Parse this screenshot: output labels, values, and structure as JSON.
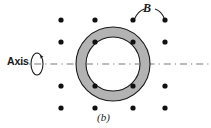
{
  "figure": {
    "panel_label": "(b)",
    "axis_label": "Axis",
    "field_label": "B",
    "colors": {
      "ring_fill": "#b3b3b3",
      "stroke": "#1a1a1a",
      "background": "#ffffff",
      "dot": "#111111",
      "axis_line": "#7a7a7a"
    },
    "geometry": {
      "center_x": 113,
      "center_y": 64,
      "outer_radius": 37,
      "inner_radius": 27,
      "axis_y": 64,
      "ellipse_cx": 37,
      "ellipse_cy": 64,
      "ellipse_rx": 6,
      "ellipse_ry": 11
    },
    "field_dots": [
      {
        "x": 61,
        "y": 20
      },
      {
        "x": 95,
        "y": 20
      },
      {
        "x": 133,
        "y": 20
      },
      {
        "x": 165,
        "y": 20
      },
      {
        "x": 61,
        "y": 42
      },
      {
        "x": 95,
        "y": 42
      },
      {
        "x": 133,
        "y": 42
      },
      {
        "x": 165,
        "y": 42
      },
      {
        "x": 61,
        "y": 86
      },
      {
        "x": 95,
        "y": 86
      },
      {
        "x": 133,
        "y": 86
      },
      {
        "x": 165,
        "y": 86
      },
      {
        "x": 61,
        "y": 108
      },
      {
        "x": 95,
        "y": 108
      },
      {
        "x": 133,
        "y": 108
      },
      {
        "x": 165,
        "y": 108
      }
    ],
    "dot_radius": 2.6
  }
}
